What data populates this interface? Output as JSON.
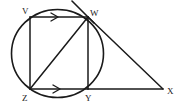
{
  "figure": {
    "background_color": "#ffffff",
    "stroke_color": "#1a1a1a",
    "circle": {
      "name": "main-circle",
      "center_x": 57.5,
      "center_y": 53.5,
      "radius_x": 46,
      "radius_y": 44
    },
    "vertices": [
      {
        "id": "V",
        "label": "V",
        "x": 30,
        "y": 17,
        "label_x": 22,
        "label_y": 14
      },
      {
        "id": "W",
        "label": "W",
        "x": 88,
        "y": 17,
        "label_x": 90,
        "label_y": 16
      },
      {
        "id": "Z",
        "label": "Z",
        "x": 30,
        "y": 89,
        "label_x": 22,
        "label_y": 101
      },
      {
        "id": "Y",
        "label": "Y",
        "x": 88,
        "y": 89,
        "label_x": 85,
        "label_y": 101
      },
      {
        "id": "X",
        "label": "X",
        "x": 163,
        "y": 89,
        "label_x": 167,
        "label_y": 94
      }
    ],
    "segments": [
      {
        "name": "segment-VW",
        "from": "V",
        "to": "W",
        "x1": 30,
        "y1": 17,
        "x2": 88,
        "y2": 17
      },
      {
        "name": "segment-VZ",
        "from": "V",
        "to": "Z",
        "x1": 30,
        "y1": 17,
        "x2": 30,
        "y2": 89
      },
      {
        "name": "segment-WY",
        "from": "W",
        "to": "Y",
        "x1": 88,
        "y1": 17,
        "x2": 88,
        "y2": 89
      },
      {
        "name": "segment-ZY",
        "from": "Z",
        "to": "Y",
        "x1": 30,
        "y1": 89,
        "x2": 88,
        "y2": 89
      },
      {
        "name": "segment-ZW-diagonal",
        "from": "Z",
        "to": "W",
        "x1": 30,
        "y1": 89,
        "x2": 88,
        "y2": 17
      },
      {
        "name": "segment-WX",
        "from": "W",
        "to": "X",
        "x1": 88,
        "y1": 17,
        "x2": 163,
        "y2": 89
      },
      {
        "name": "segment-YX",
        "from": "Y",
        "to": "X",
        "x1": 88,
        "y1": 89,
        "x2": 163,
        "y2": 89
      }
    ],
    "tangent": {
      "name": "tangent-line-at-W",
      "x1": 72,
      "y1": 1,
      "x2": 94,
      "y2": 23
    },
    "parallel_marks": [
      {
        "name": "arrow-mark-on-VW",
        "on_segment": "VW",
        "x": 55,
        "y": 17
      },
      {
        "name": "arrow-mark-on-ZY",
        "on_segment": "ZY",
        "x": 57,
        "y": 89
      }
    ]
  }
}
